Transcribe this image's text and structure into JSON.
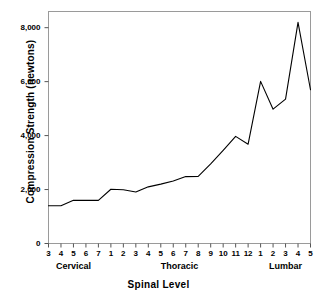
{
  "chart_data": {
    "type": "line",
    "title": "",
    "xlabel": "Spinal Level",
    "ylabel": "Compression Strength (newtons)",
    "ylim": [
      0,
      8600
    ],
    "yticks": [
      0,
      2000,
      4000,
      6000,
      8000
    ],
    "ytick_labels": [
      "0",
      "2,000",
      "4,000",
      "6,000",
      "8,000"
    ],
    "grid": false,
    "legend": null,
    "line_color": "#000000",
    "categories": [
      "3",
      "4",
      "5",
      "6",
      "7",
      "1",
      "2",
      "3",
      "4",
      "5",
      "6",
      "7",
      "8",
      "9",
      "10",
      "11",
      "12",
      "1",
      "2",
      "3",
      "4",
      "5"
    ],
    "x_tick_labels": [
      "3",
      "4",
      "5",
      "6",
      "7",
      "1",
      "2",
      "3",
      "4",
      "5",
      "6",
      "7",
      "8",
      "9",
      "10",
      "11",
      "12",
      "1",
      "2",
      "3",
      "4",
      "5"
    ],
    "values": [
      1400,
      1400,
      1600,
      1600,
      1600,
      2010,
      1990,
      1910,
      2100,
      2200,
      2320,
      2480,
      2490,
      2950,
      3450,
      3970,
      3680,
      6010,
      4980,
      5350,
      8200,
      5700
    ],
    "groups": [
      {
        "label": "Cervical",
        "levels": [
          "3",
          "4",
          "5",
          "6",
          "7"
        ],
        "start_index": 0,
        "end_index": 4
      },
      {
        "label": "Thoracic",
        "levels": [
          "1",
          "2",
          "3",
          "4",
          "5",
          "6",
          "7",
          "8",
          "9",
          "10",
          "11",
          "12"
        ],
        "start_index": 5,
        "end_index": 16
      },
      {
        "label": "Lumbar",
        "levels": [
          "1",
          "2",
          "3",
          "4",
          "5"
        ],
        "start_index": 17,
        "end_index": 21
      }
    ],
    "points": [
      {
        "region": "Cervical",
        "level": "C3",
        "value": 1400
      },
      {
        "region": "Cervical",
        "level": "C4",
        "value": 1400
      },
      {
        "region": "Cervical",
        "level": "C5",
        "value": 1600
      },
      {
        "region": "Cervical",
        "level": "C6",
        "value": 1600
      },
      {
        "region": "Cervical",
        "level": "C7",
        "value": 1600
      },
      {
        "region": "Thoracic",
        "level": "T1",
        "value": 2010
      },
      {
        "region": "Thoracic",
        "level": "T2",
        "value": 1990
      },
      {
        "region": "Thoracic",
        "level": "T3",
        "value": 1910
      },
      {
        "region": "Thoracic",
        "level": "T4",
        "value": 2100
      },
      {
        "region": "Thoracic",
        "level": "T5",
        "value": 2200
      },
      {
        "region": "Thoracic",
        "level": "T6",
        "value": 2320
      },
      {
        "region": "Thoracic",
        "level": "T7",
        "value": 2480
      },
      {
        "region": "Thoracic",
        "level": "T8",
        "value": 2490
      },
      {
        "region": "Thoracic",
        "level": "T9",
        "value": 2950
      },
      {
        "region": "Thoracic",
        "level": "T10",
        "value": 3450
      },
      {
        "region": "Thoracic",
        "level": "T11",
        "value": 3970
      },
      {
        "region": "Thoracic",
        "level": "T12",
        "value": 3680
      },
      {
        "region": "Lumbar",
        "level": "L1",
        "value": 6010
      },
      {
        "region": "Lumbar",
        "level": "L2",
        "value": 4980
      },
      {
        "region": "Lumbar",
        "level": "L3",
        "value": 5350
      },
      {
        "region": "Lumbar",
        "level": "L4",
        "value": 8200
      },
      {
        "region": "Lumbar",
        "level": "L5",
        "value": 5700
      }
    ]
  }
}
